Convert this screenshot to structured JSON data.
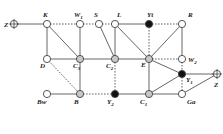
{
  "diagram": {
    "colors": {
      "edge": "#555555",
      "node_open_fill": "#ffffff",
      "node_gray_fill": "#c8c8c8",
      "node_filled": "#111111",
      "node_stroke": "#444444"
    },
    "nodes": [
      {
        "id": "Z_left",
        "label": "Z",
        "sub": "",
        "x": 14,
        "y": 24,
        "type": "crosshair",
        "lx": 4,
        "ly": 27
      },
      {
        "id": "K",
        "label": "K",
        "sub": "",
        "x": 47,
        "y": 24,
        "type": "open",
        "lx": 43,
        "ly": 17
      },
      {
        "id": "W1",
        "label": "W",
        "sub": "1",
        "x": 80,
        "y": 24,
        "type": "open",
        "lx": 74,
        "ly": 17
      },
      {
        "id": "S",
        "label": "S",
        "sub": "",
        "x": 99,
        "y": 24,
        "type": "open",
        "lx": 94,
        "ly": 17
      },
      {
        "id": "L",
        "label": "L",
        "sub": "",
        "x": 115,
        "y": 24,
        "type": "open",
        "lx": 117,
        "ly": 17
      },
      {
        "id": "Yt",
        "label": "Yt",
        "sub": "",
        "x": 149,
        "y": 24,
        "type": "filled",
        "lx": 147,
        "ly": 17
      },
      {
        "id": "R",
        "label": "R",
        "sub": "",
        "x": 182,
        "y": 24,
        "type": "open",
        "lx": 188,
        "ly": 17
      },
      {
        "id": "D",
        "label": "D",
        "sub": "",
        "x": 47,
        "y": 59,
        "type": "open",
        "lx": 40,
        "ly": 68
      },
      {
        "id": "C3",
        "label": "C",
        "sub": "3",
        "x": 80,
        "y": 59,
        "type": "gray",
        "lx": 73,
        "ly": 68
      },
      {
        "id": "C2",
        "label": "C",
        "sub": "2",
        "x": 115,
        "y": 59,
        "type": "gray",
        "lx": 106,
        "ly": 68
      },
      {
        "id": "E",
        "label": "E",
        "sub": "",
        "x": 149,
        "y": 59,
        "type": "gray",
        "lx": 141,
        "ly": 67
      },
      {
        "id": "W2",
        "label": "W",
        "sub": "2",
        "x": 182,
        "y": 59,
        "type": "open",
        "lx": 188,
        "ly": 62
      },
      {
        "id": "Y1",
        "label": "Y",
        "sub": "1",
        "x": 182,
        "y": 74,
        "type": "filled",
        "lx": 186,
        "ly": 82
      },
      {
        "id": "Z_right",
        "label": "Z",
        "sub": "",
        "x": 217,
        "y": 74,
        "type": "crosshair",
        "lx": 214,
        "ly": 87
      },
      {
        "id": "Bw",
        "label": "Bw",
        "sub": "",
        "x": 47,
        "y": 94,
        "type": "open",
        "lx": 37,
        "ly": 104
      },
      {
        "id": "B",
        "label": "B",
        "sub": "",
        "x": 80,
        "y": 94,
        "type": "gray",
        "lx": 74,
        "ly": 104
      },
      {
        "id": "Y2",
        "label": "Y",
        "sub": "2",
        "x": 115,
        "y": 94,
        "type": "filled",
        "lx": 107,
        "ly": 104
      },
      {
        "id": "C1",
        "label": "C",
        "sub": "1",
        "x": 149,
        "y": 94,
        "type": "gray",
        "lx": 140,
        "ly": 104
      },
      {
        "id": "Ga",
        "label": "Ga",
        "sub": "",
        "x": 182,
        "y": 94,
        "type": "open",
        "lx": 187,
        "ly": 104
      }
    ],
    "edges": [
      {
        "from": "Z_left",
        "to": "K",
        "style": "solid"
      },
      {
        "from": "K",
        "to": "W1",
        "style": "dashed"
      },
      {
        "from": "W1",
        "to": "S",
        "style": "dashed"
      },
      {
        "from": "S",
        "to": "L",
        "style": "dashed"
      },
      {
        "from": "L",
        "to": "Yt",
        "style": "solid"
      },
      {
        "from": "Yt",
        "to": "R",
        "style": "dashed"
      },
      {
        "from": "K",
        "to": "D",
        "style": "solid"
      },
      {
        "from": "K",
        "to": "C3",
        "style": "solid"
      },
      {
        "from": "W1",
        "to": "C3",
        "style": "solid"
      },
      {
        "from": "S",
        "to": "C2",
        "style": "solid"
      },
      {
        "from": "L",
        "to": "C2",
        "style": "solid"
      },
      {
        "from": "L",
        "to": "E",
        "style": "solid"
      },
      {
        "from": "Yt",
        "to": "E",
        "style": "dashed"
      },
      {
        "from": "R",
        "to": "E",
        "style": "solid"
      },
      {
        "from": "R",
        "to": "W2",
        "style": "solid"
      },
      {
        "from": "D",
        "to": "C3",
        "style": "solid"
      },
      {
        "from": "C3",
        "to": "C2",
        "style": "solid"
      },
      {
        "from": "C2",
        "to": "E",
        "style": "solid"
      },
      {
        "from": "E",
        "to": "W2",
        "style": "dashed"
      },
      {
        "from": "D",
        "to": "B",
        "style": "dashed"
      },
      {
        "from": "C3",
        "to": "B",
        "style": "solid"
      },
      {
        "from": "C2",
        "to": "Y2",
        "style": "dashed"
      },
      {
        "from": "E",
        "to": "C1",
        "style": "solid"
      },
      {
        "from": "E",
        "to": "Y1",
        "style": "solid"
      },
      {
        "from": "W2",
        "to": "Ga",
        "style": "dashed"
      },
      {
        "from": "Y1",
        "to": "Z_right",
        "style": "solid"
      },
      {
        "from": "Y1",
        "to": "C1",
        "style": "solid"
      },
      {
        "from": "Ga",
        "to": "Z_right",
        "style": "solid"
      },
      {
        "from": "Bw",
        "to": "B",
        "style": "solid"
      },
      {
        "from": "B",
        "to": "Y2",
        "style": "dashed"
      },
      {
        "from": "Y2",
        "to": "C1",
        "style": "solid"
      },
      {
        "from": "C1",
        "to": "Ga",
        "style": "solid"
      }
    ]
  }
}
